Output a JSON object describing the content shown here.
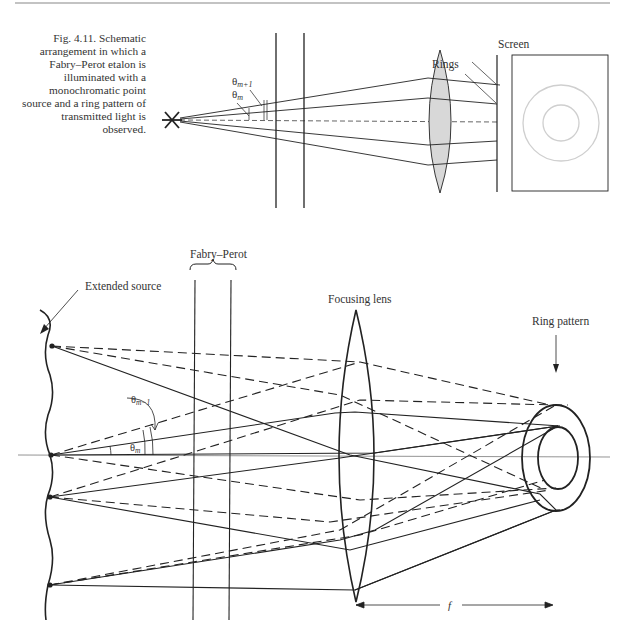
{
  "caption": {
    "label": "Fig. 4.11.",
    "text": "Fig. 4.11.  Schematic arrangement in which a Fabry–Perot etalon is illuminated with a monochromatic point source and a ring pattern of transmitted light is observed."
  },
  "top_diagram": {
    "labels": {
      "theta_m": "θ",
      "theta_m_sub": "m",
      "theta_m1": "θ",
      "theta_m1_sub": "m+1",
      "rings": "Rings",
      "screen": "Screen"
    },
    "elements": [
      "point-source",
      "etalon-plates",
      "lens",
      "screen",
      "ring-pattern"
    ]
  },
  "bottom_diagram": {
    "labels": {
      "fabry_perot": "Fabry–Perot",
      "extended_source": "Extended source",
      "focusing_lens": "Focusing lens",
      "ring_pattern": "Ring pattern",
      "theta_m": "θ",
      "theta_m_sub": "m",
      "theta_m1": "θ",
      "theta_m1_sub": "m−1",
      "focal_length": "f"
    }
  },
  "colors": {
    "ink": "#222222",
    "lens_fill": "#d8d8d8",
    "ring_light": "#cfcfcf"
  }
}
